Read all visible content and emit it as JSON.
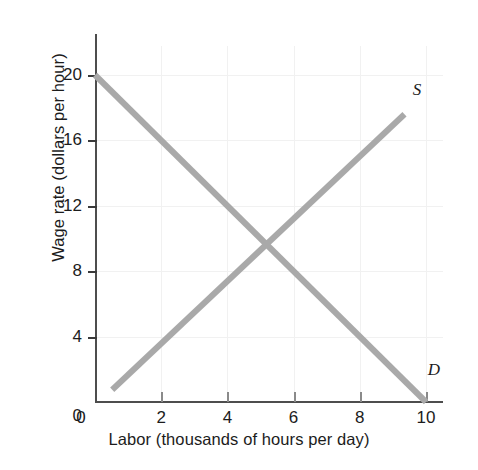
{
  "chart_data": {
    "type": "line",
    "title": "",
    "xlabel": "Labor (thousands of hours per day)",
    "ylabel": "Wage rate (dollars per hour)",
    "xlim": [
      0,
      10.5
    ],
    "ylim": [
      0,
      22
    ],
    "grid": true,
    "legend_position": "inline-curve-end",
    "x_ticks": [
      {
        "value": 0,
        "label": "0"
      },
      {
        "value": 2,
        "label": "2"
      },
      {
        "value": 4,
        "label": "4"
      },
      {
        "value": 6,
        "label": "6"
      },
      {
        "value": 8,
        "label": "8"
      },
      {
        "value": 10,
        "label": "10"
      }
    ],
    "y_ticks": [
      {
        "value": 0,
        "label": "0"
      },
      {
        "value": 4,
        "label": "4"
      },
      {
        "value": 8,
        "label": "8"
      },
      {
        "value": 12,
        "label": "12"
      },
      {
        "value": 16,
        "label": "16"
      },
      {
        "value": 20,
        "label": "20"
      }
    ],
    "series": [
      {
        "name": "D",
        "label": "D",
        "description": "Demand curve, downward sloping",
        "color": "#a9a9a9",
        "points": [
          {
            "x": 0,
            "y": 20
          },
          {
            "x": 10,
            "y": 0
          }
        ],
        "label_position": {
          "x": 10.05,
          "y": 1.9
        }
      },
      {
        "name": "S",
        "label": "S",
        "description": "Supply curve, upward sloping",
        "color": "#a9a9a9",
        "points": [
          {
            "x": 0.52,
            "y": 0.75
          },
          {
            "x": 9.35,
            "y": 17.6
          }
        ],
        "label_position": {
          "x": 9.6,
          "y": 19.0
        }
      }
    ],
    "equilibrium": {
      "x": 5,
      "y": 10,
      "shown_as_marker": false
    }
  },
  "axis": {
    "x_title": "Labor (thousands of hours per day)",
    "y_title": "Wage rate (dollars per hour)"
  },
  "colors": {
    "curve": "#a9a9a9",
    "axis": "#4d4d4d",
    "grid": "#f1f1f1",
    "text": "#1c1c1c",
    "background": "#ffffff"
  }
}
